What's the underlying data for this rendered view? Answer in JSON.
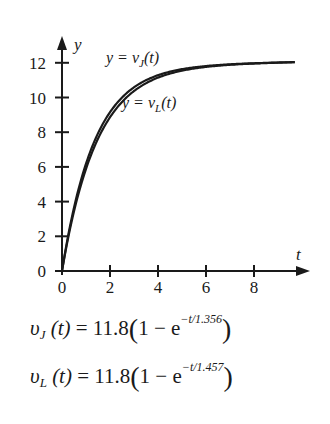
{
  "chart_data": {
    "type": "line",
    "title": "",
    "xlabel": "t",
    "ylabel": "y",
    "xlim": [
      0,
      10
    ],
    "ylim": [
      0,
      13
    ],
    "x_ticks": [
      "0",
      "2",
      "4",
      "6",
      "8"
    ],
    "y_ticks": [
      "0",
      "2",
      "4",
      "6",
      "8",
      "10",
      "12"
    ],
    "grid": false,
    "legend": "inline annotations",
    "series": [
      {
        "name": "y = v_J(t)",
        "formula": "11.8(1 - e^(-t/1.356))",
        "x": [
          0,
          0.5,
          1,
          2,
          3,
          4,
          5,
          6,
          7,
          8,
          9,
          9.7
        ],
        "values": [
          0,
          3.65,
          6.17,
          9.0,
          10.5,
          11.18,
          11.51,
          11.66,
          11.74,
          11.77,
          11.79,
          11.79
        ]
      },
      {
        "name": "y = v_L(t)",
        "formula": "11.8(1 - e^(-t/1.457))",
        "x": [
          0,
          0.5,
          1,
          2,
          3,
          4,
          5,
          6,
          7,
          8,
          9,
          9.7
        ],
        "values": [
          0,
          3.45,
          5.89,
          8.7,
          10.28,
          11.05,
          11.43,
          11.61,
          11.71,
          11.75,
          11.78,
          11.79
        ]
      }
    ],
    "annotations": [
      {
        "text_prefix": "y = v",
        "sub": "J",
        "suffix": "(t)"
      },
      {
        "text_prefix": "y = v",
        "sub": "L",
        "suffix": "(t)"
      }
    ]
  },
  "labels": {
    "y_axis": "y",
    "x_axis": "t",
    "curve_j": {
      "prefix": "y = v",
      "sub": "J",
      "suffix": "(t)"
    },
    "curve_l": {
      "prefix": "y = v",
      "sub": "L",
      "suffix": "(t)"
    }
  },
  "equations": [
    {
      "v": "υ",
      "sub": "J",
      "arg": "(t)",
      "eq": " = 11.8",
      "open": "(",
      "one": "1 − e",
      "exp": "−t/1.356",
      "close": ")"
    },
    {
      "v": "υ",
      "sub": "L",
      "arg": "(t)",
      "eq": " = 11.8",
      "open": "(",
      "one": "1 − e",
      "exp": "−t/1.457",
      "close": ")"
    }
  ]
}
